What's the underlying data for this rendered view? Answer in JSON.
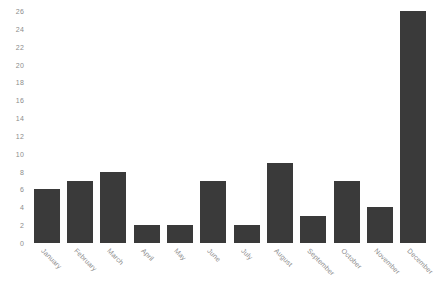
{
  "chart_data": {
    "type": "bar",
    "title": "",
    "subtitle": "",
    "xlabel": "",
    "ylabel": "",
    "categories": [
      "January",
      "February",
      "March",
      "April",
      "May",
      "June",
      "July",
      "August",
      "September",
      "October",
      "November",
      "December"
    ],
    "values": [
      6,
      7,
      8,
      2,
      2,
      7,
      2,
      9,
      3,
      7,
      4,
      26
    ],
    "ylim": [
      0,
      26
    ],
    "yticks": [
      0,
      2,
      4,
      6,
      8,
      10,
      12,
      14,
      16,
      18,
      20,
      22,
      24,
      26
    ],
    "ytick_labels": [
      "0",
      "2",
      "4",
      "6",
      "8",
      "10",
      "12",
      "14",
      "16",
      "18",
      "20",
      "22",
      "24",
      "26"
    ],
    "grid": false,
    "legend": false,
    "legend_position": "none",
    "bar_color": "#3a3a3a",
    "tick_label_color": "#8c8c8c",
    "background_color": "#ffffff",
    "xtick_label_rotation": 45
  }
}
